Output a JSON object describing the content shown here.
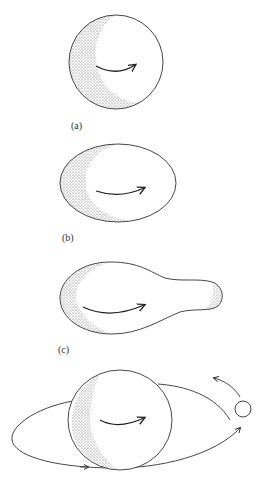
{
  "figure": {
    "panels": [
      {
        "id": "a",
        "label": "(a)",
        "shape": "sphere",
        "description": "Rotating sphere with shaded limb and rotation arrow"
      },
      {
        "id": "b",
        "label": "(b)",
        "shape": "oblate ellipsoid",
        "description": "Spheroid elongated by faster rotation"
      },
      {
        "id": "c",
        "label": "(c)",
        "shape": "pear-shaped body",
        "description": "Elongated body developing a neck/bulge"
      },
      {
        "id": "d",
        "label": "",
        "shape": "body with orbiting satellite",
        "description": "Separated satellite orbiting the main body, with orbit and motion arrows"
      }
    ],
    "colors": {
      "stroke": "#333333",
      "shading": "#555555",
      "background": "#ffffff"
    },
    "caption_fragment": ""
  }
}
